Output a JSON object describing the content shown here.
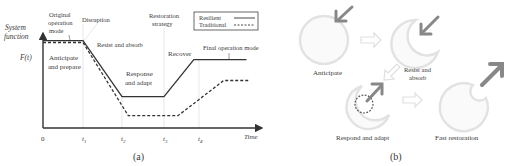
{
  "panel_a": {
    "caption": "(a)",
    "y_axis_label_line1": "System",
    "y_axis_label_line2": "function",
    "y_value_label": "F(t)",
    "x_axis_label": "Time",
    "x_ticks": [
      "0",
      "t1",
      "t2",
      "t3",
      "t4"
    ],
    "legend": [
      {
        "name": "Resilient",
        "style": "solid"
      },
      {
        "name": "Traditional",
        "style": "dashed"
      }
    ],
    "annotations": {
      "original_mode_1": "Original",
      "original_mode_2": "operation",
      "original_mode_3": "mode",
      "disruption": "Disruption",
      "restoration_1": "Restoration",
      "restoration_2": "strategy",
      "anticipate_1": "Anticipate",
      "anticipate_2": "and prepare",
      "resist": "Resist and absorb",
      "response_1": "Response",
      "response_2": "and adapt",
      "recover": "Recover",
      "final_mode": "Final operation mode"
    }
  },
  "chart_data": {
    "type": "line",
    "title": "",
    "xlabel": "Time",
    "ylabel": "System function F(t)",
    "x_ticks": [
      "0",
      "t1",
      "t2",
      "t3",
      "t4"
    ],
    "series": [
      {
        "name": "Resilient",
        "style": "solid",
        "points": [
          [
            0,
            0.92
          ],
          [
            1,
            0.92
          ],
          [
            2,
            0.33
          ],
          [
            3,
            0.33
          ],
          [
            3.85,
            0.72
          ],
          [
            5.25,
            0.72
          ]
        ]
      },
      {
        "name": "Traditional",
        "style": "dashed",
        "points": [
          [
            0,
            0.9
          ],
          [
            1,
            0.9
          ],
          [
            2.15,
            0.13
          ],
          [
            3.4,
            0.13
          ],
          [
            4.65,
            0.5
          ],
          [
            5.3,
            0.5
          ]
        ]
      }
    ],
    "legend_position": "top-right",
    "grid": false
  },
  "panel_b": {
    "caption": "(b)",
    "stages": [
      {
        "label": "Anticipate"
      },
      {
        "label_1": "Resist and",
        "label_2": "absorb"
      },
      {
        "label": "Respond and adapt"
      },
      {
        "label": "Fast restoration"
      }
    ]
  }
}
